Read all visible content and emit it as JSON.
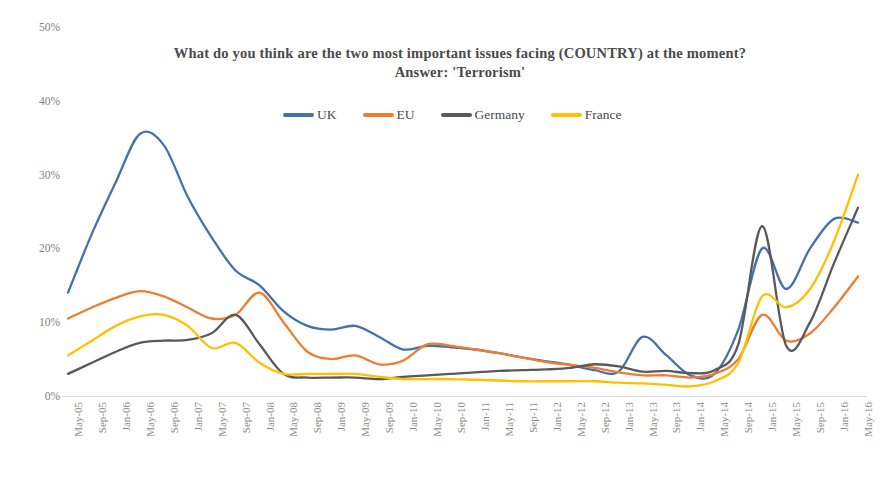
{
  "chart_data": {
    "type": "line",
    "title": "What do you think are the two most important issues facing (COUNTRY) at the moment?",
    "subtitle": "Answer: 'Terrorism'",
    "xlabel": "",
    "ylabel": "",
    "ylim": [
      0,
      50
    ],
    "ytick_labels": [
      "0%",
      "10%",
      "20%",
      "30%",
      "40%",
      "50%"
    ],
    "ytick_values": [
      0,
      10,
      20,
      30,
      40,
      50
    ],
    "grid": false,
    "legend_position": "top",
    "categories": [
      "May-05",
      "Sep-05",
      "Jan-06",
      "May-06",
      "Sep-06",
      "Jan-07",
      "May-07",
      "Sep-07",
      "Jan-08",
      "May-08",
      "Sep-08",
      "Jan-09",
      "May-09",
      "Sep-09",
      "Jan-10",
      "May-10",
      "Sep-10",
      "Jan-11",
      "May-11",
      "Sep-11",
      "Jan-12",
      "May-12",
      "Sep-12",
      "Jan-13",
      "May-13",
      "Sep-13",
      "Jan-14",
      "May-14",
      "Sep-14",
      "Jan-15",
      "May-15",
      "Sep-15",
      "Jan-16",
      "May-16"
    ],
    "series": [
      {
        "name": "UK",
        "color": "#4472a8",
        "values": [
          14.0,
          22.0,
          29.0,
          35.5,
          34.0,
          27.0,
          21.5,
          17.0,
          15.0,
          11.5,
          9.5,
          9.0,
          9.5,
          8.0,
          6.3,
          6.8,
          6.6,
          6.3,
          5.8,
          5.2,
          4.7,
          4.2,
          3.5,
          3.3,
          8.0,
          5.5,
          2.8,
          3.0,
          9.0,
          20.0,
          14.5,
          20.0,
          24.0,
          23.5
        ]
      },
      {
        "name": "EU",
        "color": "#ed7d31",
        "values": [
          10.5,
          12.0,
          13.3,
          14.2,
          13.5,
          12.0,
          10.5,
          11.0,
          14.0,
          10.0,
          6.0,
          5.0,
          5.5,
          4.3,
          4.8,
          7.0,
          6.8,
          6.3,
          5.8,
          5.2,
          4.6,
          4.2,
          3.8,
          3.2,
          2.8,
          2.8,
          2.5,
          3.0,
          5.0,
          11.0,
          7.5,
          8.5,
          12.0,
          16.2
        ]
      },
      {
        "name": "Germany",
        "color": "#595959",
        "values": [
          3.0,
          4.5,
          6.0,
          7.2,
          7.5,
          7.6,
          8.5,
          11.0,
          7.0,
          3.0,
          2.5,
          2.5,
          2.5,
          2.3,
          2.6,
          2.8,
          3.0,
          3.2,
          3.4,
          3.5,
          3.6,
          3.8,
          4.3,
          4.0,
          3.3,
          3.4,
          3.1,
          3.5,
          7.0,
          23.0,
          6.8,
          10.0,
          18.0,
          25.5
        ]
      },
      {
        "name": "France",
        "color": "#ffc000",
        "values": [
          5.5,
          7.5,
          9.5,
          10.8,
          11.0,
          9.5,
          6.5,
          7.2,
          4.5,
          3.0,
          3.0,
          3.0,
          3.0,
          2.6,
          2.3,
          2.3,
          2.3,
          2.2,
          2.1,
          2.0,
          2.0,
          2.0,
          2.0,
          1.8,
          1.7,
          1.5,
          1.3,
          2.0,
          4.5,
          13.5,
          12.0,
          14.5,
          21.0,
          30.0
        ]
      }
    ]
  },
  "legend": {
    "items": [
      {
        "label": "UK",
        "color": "#4472a8"
      },
      {
        "label": "EU",
        "color": "#ed7d31"
      },
      {
        "label": "Germany",
        "color": "#595959"
      },
      {
        "label": "France",
        "color": "#ffc000"
      }
    ]
  }
}
